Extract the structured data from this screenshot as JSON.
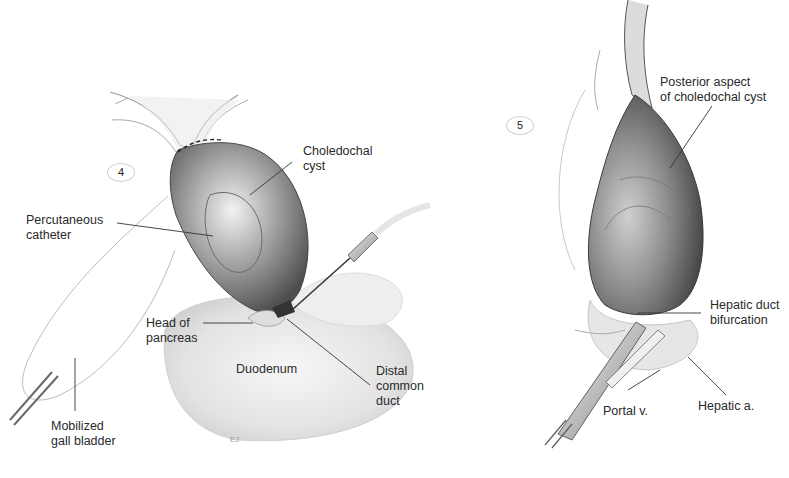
{
  "figure": {
    "caption_fragment": "",
    "panels": [
      {
        "id": "panel-4",
        "step_number": "4",
        "labels": [
          {
            "key": "choledochal-cyst",
            "text": "Choledochal\ncyst"
          },
          {
            "key": "percutaneous-catheter",
            "text": "Percutaneous\ncatheter"
          },
          {
            "key": "head-of-pancreas",
            "text": "Head of\npancreas"
          },
          {
            "key": "duodenum",
            "text": "Duodenum"
          },
          {
            "key": "distal-common-duct",
            "text": "Distal\ncommon\nduct"
          },
          {
            "key": "mobilized-gall-bladder",
            "text": "Mobilized\ngall bladder"
          }
        ]
      },
      {
        "id": "panel-5",
        "step_number": "5",
        "labels": [
          {
            "key": "posterior-aspect",
            "text": "Posterior aspect\nof choledochal cyst"
          },
          {
            "key": "hepatic-duct-bifurcation",
            "text": "Hepatic duct\nbifurcation"
          },
          {
            "key": "portal-v",
            "text": "Portal v."
          },
          {
            "key": "hepatic-a",
            "text": "Hepatic a."
          }
        ]
      }
    ],
    "colors": {
      "background": "#ffffff",
      "label_text": "#2a2a2a",
      "leader_line": "#333333",
      "tissue_dark": "#5a5a5a",
      "tissue_light": "#d8d8d8"
    }
  }
}
